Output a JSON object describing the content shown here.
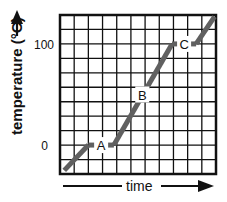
{
  "chart_data": {
    "type": "line",
    "title": "",
    "xlabel": "time",
    "ylabel": "temperature (°C)",
    "x_axis": {
      "tick_labels": [],
      "range": [
        0,
        11
      ],
      "direction_arrow": true
    },
    "y_axis": {
      "tick_labels": [
        "0",
        "100"
      ],
      "tick_values": [
        0,
        100
      ],
      "range": [
        -28.6,
        128.6
      ],
      "direction_arrow": true
    },
    "grid": true,
    "grid_columns": 11,
    "grid_rows": 11,
    "series": [
      {
        "name": "heating curve",
        "color": "#606060",
        "points": [
          {
            "x": 0.3,
            "y": -25
          },
          {
            "x": 2.0,
            "y": 0
          },
          {
            "x": 3.8,
            "y": 0
          },
          {
            "x": 7.9,
            "y": 100
          },
          {
            "x": 9.6,
            "y": 100
          },
          {
            "x": 10.9,
            "y": 127
          }
        ]
      }
    ],
    "annotations": [
      {
        "label": "A",
        "x": 2.9,
        "y": 0,
        "note": "melting plateau"
      },
      {
        "label": "B",
        "x": 5.8,
        "y": 50,
        "note": "heating liquid"
      },
      {
        "label": "C",
        "x": 8.75,
        "y": 100,
        "note": "boiling plateau"
      }
    ]
  }
}
